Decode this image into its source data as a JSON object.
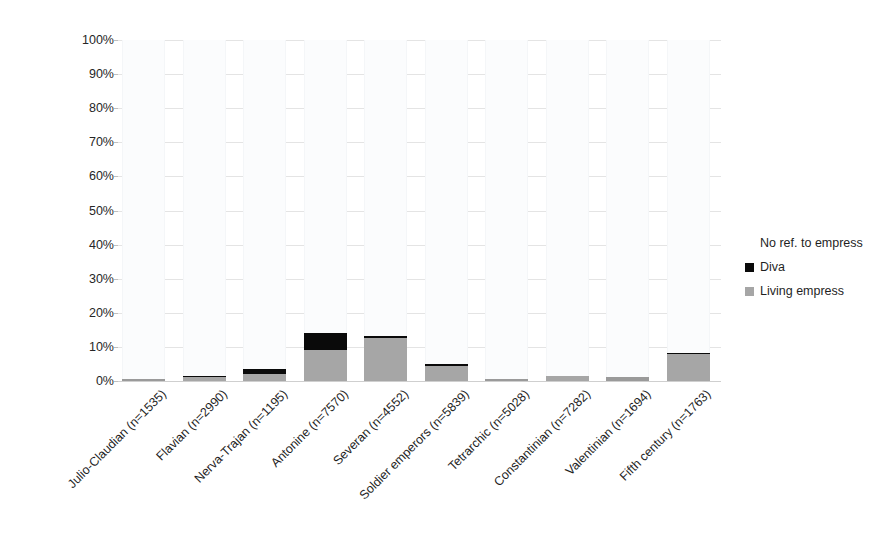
{
  "chart_data": {
    "type": "bar",
    "stacked": true,
    "stack_mode": "percent",
    "title": "",
    "xlabel": "",
    "ylabel": "",
    "ylim": [
      0,
      100
    ],
    "ytick_labels": [
      "100%",
      "90%",
      "80%",
      "70%",
      "60%",
      "50%",
      "40%",
      "30%",
      "20%",
      "10%",
      "0%"
    ],
    "ytick_values": [
      100,
      90,
      80,
      70,
      60,
      50,
      40,
      30,
      20,
      10,
      0
    ],
    "grid": true,
    "legend_position": "right",
    "categories": [
      "Julio-Claudian (n=1535)",
      "Flavian (n=2990)",
      "Nerva-Trajan (n=1195)",
      "Antonine (n=7570)",
      "Severan (n=4552)",
      "Soldier emperors (n=5839)",
      "Tetrarchic (n=5028)",
      "Constantinian (n=7282)",
      "Valentinian (n=1694)",
      "Fifth century (n=1763)"
    ],
    "series": [
      {
        "name": "Living empress",
        "color": "#a6a6a6",
        "values": [
          0.5,
          1.2,
          2.2,
          9.0,
          12.5,
          4.3,
          0.5,
          1.5,
          1.1,
          8.0
        ]
      },
      {
        "name": "Diva",
        "color": "#0a0a0a",
        "values": [
          0.0,
          0.2,
          1.4,
          5.0,
          0.7,
          0.7,
          0.2,
          0.1,
          0.1,
          0.2
        ]
      },
      {
        "name": "No ref. to empress",
        "color": "#fbfcfd",
        "values": [
          99.5,
          98.6,
          96.4,
          86.0,
          86.8,
          95.0,
          99.3,
          98.4,
          98.8,
          91.8
        ]
      }
    ]
  },
  "legend": {
    "items": [
      {
        "label": "No ref. to empress",
        "swatch_class": "sw-noref",
        "name": "legend-item-no-ref"
      },
      {
        "label": "Diva",
        "swatch_class": "sw-diva",
        "name": "legend-item-diva"
      },
      {
        "label": "Living empress",
        "swatch_class": "sw-living",
        "name": "legend-item-living-empress"
      }
    ]
  }
}
